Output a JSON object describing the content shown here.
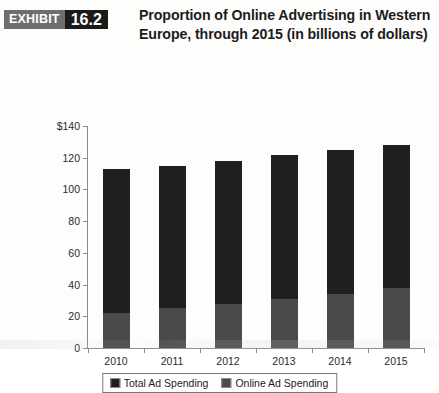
{
  "exhibit": {
    "badge_word": "EXHIBIT",
    "badge_number": "16.2",
    "title": "Proportion of Online Advertising in Western Europe, through 2015 (in billions of dollars)"
  },
  "colors": {
    "total_ad_spending": "#1f1f1f",
    "online_ad_spending": "#4a4a4a",
    "axis": "#8a8a8a",
    "badge_word_bg": "#6e6e6e",
    "badge_number_bg": "#1a1a1a"
  },
  "chart_data": {
    "type": "bar",
    "title": "Proportion of Online Advertising in Western Europe, through 2015 (in billions of dollars)",
    "xlabel": "",
    "ylabel": "",
    "categories": [
      "2010",
      "2011",
      "2012",
      "2013",
      "2014",
      "2015"
    ],
    "series": [
      {
        "name": "Total Ad Spending",
        "values": [
          113,
          115,
          118,
          122,
          125,
          128
        ]
      },
      {
        "name": "Online Ad Spending",
        "values": [
          22,
          25,
          28,
          31,
          34,
          38
        ]
      }
    ],
    "stacked": true,
    "ylim": [
      0,
      140
    ],
    "yticks": [
      0,
      20,
      40,
      60,
      80,
      100,
      120,
      140
    ],
    "ytick_labels": [
      "0",
      "20",
      "40",
      "60",
      "80",
      "100",
      "120",
      "$140"
    ],
    "grid": false,
    "legend_position": "bottom"
  },
  "legend": {
    "items": [
      {
        "label": "Total Ad Spending",
        "color_key": "total_ad_spending"
      },
      {
        "label": "Online Ad Spending",
        "color_key": "online_ad_spending"
      }
    ]
  }
}
